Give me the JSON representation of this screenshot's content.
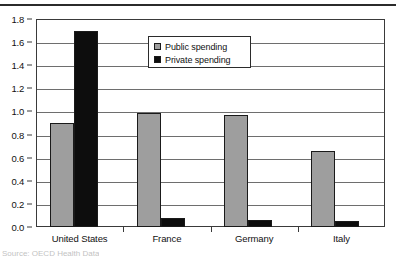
{
  "chart_data": {
    "type": "bar",
    "title": "",
    "xlabel": "",
    "ylabel": "",
    "categories": [
      "United States",
      "France",
      "Germany",
      "Italy"
    ],
    "series": [
      {
        "name": "Public spending",
        "color": "#9e9e9e",
        "values": [
          0.9,
          0.99,
          0.97,
          0.66
        ]
      },
      {
        "name": "Private spending",
        "color": "#0d0d0d",
        "values": [
          1.7,
          0.08,
          0.06,
          0.05
        ]
      }
    ],
    "ylim": [
      0.0,
      1.8
    ],
    "ytick_step": 0.2,
    "ytick_labels": [
      "1.8",
      "1.6",
      "1.4",
      "1.2",
      "1.0",
      "0.8",
      "0.6",
      "0.4",
      "0.2",
      "0.0"
    ],
    "grid": true,
    "legend_position": "inside-top-center"
  },
  "legend": {
    "items": [
      {
        "label": "Public spending",
        "swatch": "public"
      },
      {
        "label": "Private spending",
        "swatch": "private"
      }
    ]
  },
  "caption": {
    "source_text": "Source:  OECD Health Data"
  }
}
